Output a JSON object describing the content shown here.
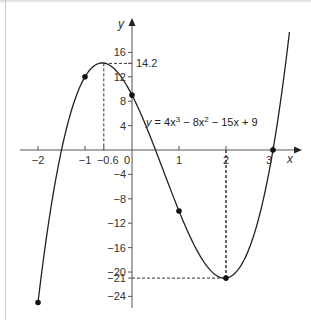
{
  "chart_data": {
    "type": "line",
    "title": "",
    "equation": "y = 4x³ − 8x² − 15x + 9",
    "equation_parts": {
      "lhs": "y",
      "t1": "4x",
      "e1": "3",
      "t2": " − 8x",
      "e2": "2",
      "t3": " − 15x + 9"
    },
    "xlabel": "x",
    "ylabel": "y",
    "xlim": [
      -2.2,
      3.4
    ],
    "ylim": [
      -25,
      18
    ],
    "grid": false,
    "x_ticks": [
      {
        "value": -2,
        "label": "−2"
      },
      {
        "value": -1,
        "label": "−1"
      },
      {
        "value": -0.6,
        "label": "−0.6"
      },
      {
        "value": 0,
        "label": "0"
      },
      {
        "value": 1,
        "label": "1"
      },
      {
        "value": 2,
        "label": "2"
      },
      {
        "value": 3,
        "label": "3"
      }
    ],
    "y_ticks": [
      {
        "value": 16,
        "label": "16"
      },
      {
        "value": 14.2,
        "label": "14.2"
      },
      {
        "value": 12,
        "label": "12"
      },
      {
        "value": 8,
        "label": "8"
      },
      {
        "value": 4,
        "label": "4"
      },
      {
        "value": -4,
        "label": "−4"
      },
      {
        "value": -8,
        "label": "−8"
      },
      {
        "value": -12,
        "label": "−12"
      },
      {
        "value": -16,
        "label": "−16"
      },
      {
        "value": -20,
        "label": "−20"
      },
      {
        "value": -21,
        "label": "−21"
      },
      {
        "value": -24,
        "label": "−24"
      }
    ],
    "marked_points": [
      {
        "x": -2,
        "y": -25
      },
      {
        "x": -1,
        "y": 12
      },
      {
        "x": 0,
        "y": 9
      },
      {
        "x": 1,
        "y": -10
      },
      {
        "x": 2,
        "y": -21
      },
      {
        "x": 3,
        "y": 0
      }
    ],
    "annotations": [
      {
        "type": "local_max",
        "x": -0.6,
        "y": 14.2,
        "dashed_guides": true
      },
      {
        "type": "local_min",
        "x": 2,
        "y": -21,
        "dashed_guides": true
      }
    ],
    "series": [
      {
        "name": "y = 4x³ − 8x² − 15x + 9",
        "coefficients": [
          4,
          -8,
          -15,
          9
        ],
        "x_range": [
          -2,
          3.35
        ]
      }
    ]
  }
}
